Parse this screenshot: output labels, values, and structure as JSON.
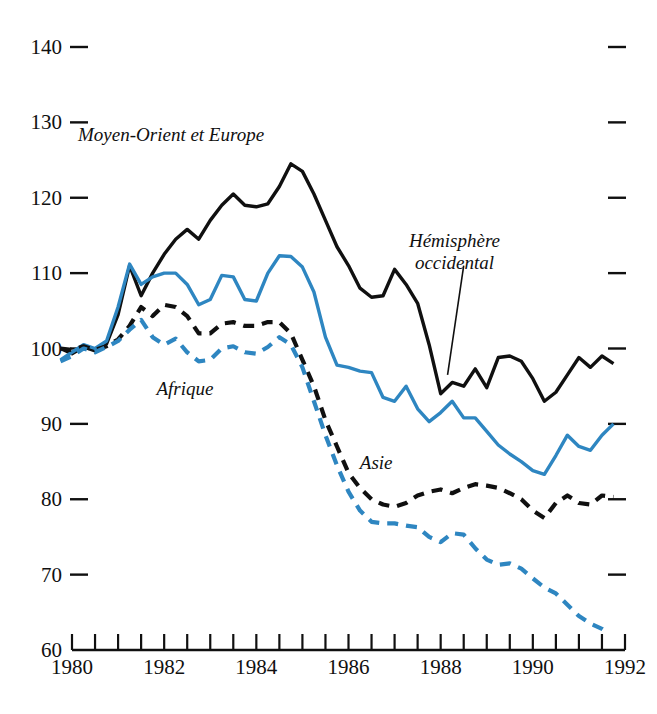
{
  "chart_data": {
    "type": "line",
    "title": "",
    "subtitle": "",
    "xlabel": "",
    "ylabel": "",
    "xlim": [
      1979.6,
      1992.1
    ],
    "ylim": [
      60,
      140
    ],
    "grid": false,
    "legend_position": "inline-annotations",
    "y_ticks": [
      140,
      130,
      120,
      110,
      100,
      90,
      80,
      70,
      60
    ],
    "y_tick_labels": [
      "140",
      "130",
      "120",
      "110",
      "100",
      "90",
      "80",
      "70",
      "60"
    ],
    "right_axis_ticks": [
      140,
      130,
      120,
      110,
      100,
      90,
      80,
      70
    ],
    "x_ticks": [
      1980,
      1981,
      1982,
      1983,
      1984,
      1985,
      1986,
      1987,
      1988,
      1989,
      1990,
      1991,
      1992
    ],
    "x_tick_labels": [
      "1980",
      "",
      "1982",
      "",
      "1984",
      "",
      "1986",
      "",
      "1988",
      "",
      "1990",
      "",
      "1992"
    ],
    "x_visible_labels": [
      "1980",
      "1982",
      "1984",
      "1986",
      "1988",
      "1990",
      "1992"
    ],
    "colors": {
      "black": "#101010",
      "blue": "#2E86C1"
    },
    "series": [
      {
        "name": "Moyen-Orient et Europe",
        "color": "#101010",
        "style": "solid",
        "label_x": 1982.15,
        "label_y": 127.5,
        "x": [
          1979.75,
          1980.0,
          1980.25,
          1980.5,
          1980.75,
          1981.0,
          1981.25,
          1981.5,
          1981.75,
          1982.0,
          1982.25,
          1982.5,
          1982.75,
          1983.0,
          1983.25,
          1983.5,
          1983.75,
          1984.0,
          1984.25,
          1984.5,
          1984.75,
          1985.0,
          1985.25,
          1985.5,
          1985.75,
          1986.0,
          1986.25,
          1986.5,
          1986.75,
          1987.0,
          1987.25,
          1987.5,
          1987.75,
          1988.0,
          1988.25,
          1988.5,
          1988.75,
          1989.0,
          1989.25,
          1989.5,
          1989.75,
          1990.0,
          1990.25,
          1990.5,
          1990.75,
          1991.0,
          1991.25,
          1991.5,
          1991.75
        ],
        "y": [
          100.0,
          99.3,
          100.2,
          99.7,
          100.6,
          104.5,
          111.0,
          107.0,
          110.0,
          112.5,
          114.5,
          115.8,
          114.5,
          117.0,
          119.0,
          120.5,
          119.0,
          118.8,
          119.2,
          121.5,
          124.5,
          123.5,
          120.5,
          117.0,
          113.5,
          111.0,
          108.0,
          106.8,
          107.0,
          110.5,
          108.5,
          106.0,
          100.5,
          94.0,
          95.5,
          95.0,
          97.3,
          94.8,
          98.8,
          99.0,
          98.3,
          96.0,
          93.0,
          94.2,
          96.5,
          98.8,
          97.5,
          99.0,
          98.0
        ]
      },
      {
        "name": "Hémisphère occidental",
        "color": "#2E86C1",
        "style": "solid",
        "label_x": 1988.3,
        "label_y": 113.5,
        "leader_from": [
          1988.5,
          111.0
        ],
        "leader_to": [
          1988.15,
          96.5
        ],
        "x": [
          1979.75,
          1980.0,
          1980.25,
          1980.5,
          1980.75,
          1981.0,
          1981.25,
          1981.5,
          1981.75,
          1982.0,
          1982.25,
          1982.5,
          1982.75,
          1983.0,
          1983.25,
          1983.5,
          1983.75,
          1984.0,
          1984.25,
          1984.5,
          1984.75,
          1985.0,
          1985.25,
          1985.5,
          1985.75,
          1986.0,
          1986.25,
          1986.5,
          1986.75,
          1987.0,
          1987.25,
          1987.5,
          1987.75,
          1988.0,
          1988.25,
          1988.5,
          1988.75,
          1989.0,
          1989.25,
          1989.5,
          1989.75,
          1990.0,
          1990.25,
          1990.5,
          1990.75,
          1991.0,
          1991.25,
          1991.5,
          1991.75
        ],
        "y": [
          98.5,
          99.5,
          100.5,
          100.0,
          101.0,
          105.5,
          111.2,
          108.5,
          109.5,
          110.0,
          110.0,
          108.5,
          105.8,
          106.5,
          109.7,
          109.5,
          106.5,
          106.3,
          110.0,
          112.3,
          112.2,
          110.8,
          107.5,
          101.5,
          97.8,
          97.5,
          97.0,
          96.8,
          93.5,
          93.0,
          95.0,
          92.0,
          90.3,
          91.5,
          93.0,
          90.8,
          90.8,
          89.0,
          87.2,
          86.0,
          85.0,
          83.8,
          83.3,
          85.8,
          88.5,
          87.0,
          86.5,
          88.5,
          90.0
        ]
      },
      {
        "name": "Asie",
        "color": "#101010",
        "style": "dashed",
        "label_x": 1986.6,
        "label_y": 84.0,
        "x": [
          1979.75,
          1980.0,
          1980.25,
          1980.5,
          1980.75,
          1981.0,
          1981.25,
          1981.5,
          1981.75,
          1982.0,
          1982.25,
          1982.5,
          1982.75,
          1983.0,
          1983.25,
          1983.5,
          1983.75,
          1984.0,
          1984.25,
          1984.5,
          1984.75,
          1985.0,
          1985.25,
          1985.5,
          1985.75,
          1986.0,
          1986.25,
          1986.5,
          1986.75,
          1987.0,
          1987.25,
          1987.5,
          1987.75,
          1988.0,
          1988.25,
          1988.5,
          1988.75,
          1989.0,
          1989.25,
          1989.5,
          1989.75,
          1990.0,
          1990.25,
          1990.5,
          1990.75,
          1991.0,
          1991.25,
          1991.5,
          1991.75
        ],
        "y": [
          100.0,
          99.8,
          100.3,
          99.8,
          100.3,
          101.2,
          103.0,
          105.5,
          104.3,
          105.8,
          105.5,
          104.3,
          102.0,
          102.0,
          103.3,
          103.5,
          103.0,
          103.0,
          103.5,
          103.5,
          102.0,
          98.5,
          95.0,
          90.5,
          87.0,
          83.5,
          81.5,
          80.0,
          79.3,
          79.0,
          79.5,
          80.5,
          81.0,
          81.3,
          80.8,
          81.5,
          82.0,
          81.8,
          81.5,
          80.8,
          80.0,
          78.5,
          77.5,
          79.5,
          80.5,
          79.5,
          79.3,
          80.5,
          80.3
        ]
      },
      {
        "name": "Afrique",
        "color": "#2E86C1",
        "style": "dashed",
        "label_x": 1982.45,
        "label_y": 93.8,
        "x": [
          1979.75,
          1980.0,
          1980.25,
          1980.5,
          1980.75,
          1981.0,
          1981.25,
          1981.5,
          1981.75,
          1982.0,
          1982.25,
          1982.5,
          1982.75,
          1983.0,
          1983.25,
          1983.5,
          1983.75,
          1984.0,
          1984.25,
          1984.5,
          1984.75,
          1985.0,
          1985.25,
          1985.5,
          1985.75,
          1986.0,
          1986.25,
          1986.5,
          1986.75,
          1987.0,
          1987.25,
          1987.5,
          1987.75,
          1988.0,
          1988.25,
          1988.5,
          1988.75,
          1989.0,
          1989.25,
          1989.5,
          1989.75,
          1990.0,
          1990.25,
          1990.5,
          1990.75,
          1991.0,
          1991.25,
          1991.5,
          1991.63
        ],
        "y": [
          98.3,
          99.0,
          100.0,
          99.5,
          100.2,
          101.0,
          102.5,
          103.8,
          101.5,
          100.5,
          101.3,
          99.5,
          98.3,
          98.5,
          100.0,
          100.3,
          99.5,
          99.3,
          100.2,
          101.5,
          100.5,
          97.5,
          93.0,
          88.5,
          84.5,
          81.0,
          78.5,
          77.0,
          76.8,
          76.8,
          76.5,
          76.3,
          75.0,
          74.3,
          75.5,
          75.3,
          73.5,
          72.0,
          71.3,
          71.5,
          70.8,
          69.5,
          68.3,
          67.5,
          66.0,
          64.5,
          63.5,
          62.8,
          62.3
        ]
      }
    ]
  },
  "annotations": {
    "moyen_orient": "Moyen-Orient et Europe",
    "hemisphere_line1": "Hémisphère",
    "hemisphere_line2": "occidental",
    "afrique": "Afrique",
    "asie": "Asie"
  }
}
